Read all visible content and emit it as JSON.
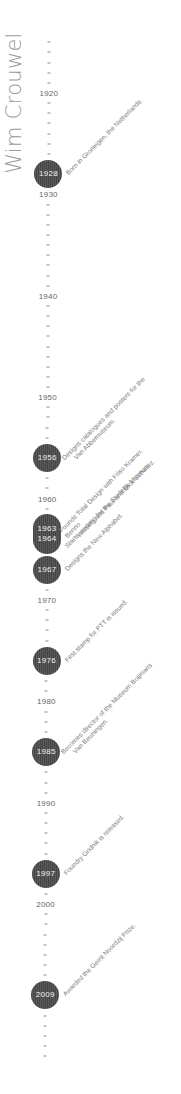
{
  "title": "Wim Crouwel",
  "axis": {
    "start_year": 1915,
    "end_year": 2015,
    "origin_year": 1920,
    "origin_y": 93,
    "px_per_year": 10.14,
    "x_top": 49,
    "x_bottom": 45,
    "decade_labels": [
      "1920",
      "1930",
      "1940",
      "1950",
      "1960",
      "1970",
      "1980",
      "1990",
      "2000"
    ]
  },
  "events": [
    {
      "years": [
        "1928"
      ],
      "lines": [
        "Born in Groningen, the Netherlands."
      ]
    },
    {
      "years": [
        "1956"
      ],
      "lines": [
        "Designs catalogues and posters for the",
        "Van Abbemuseum."
      ]
    },
    {
      "years": [
        "1963",
        "1964"
      ],
      "lines": [
        "Founds Total Design with Friso Kramer, Benno",
        "Wissing and Paul and Dick Schwarz."
      ],
      "lines_b": [
        "Starts working for the Stedelijk Museum."
      ]
    },
    {
      "years": [
        "1967"
      ],
      "lines": [
        "Designs the New Alphabet."
      ]
    },
    {
      "years": [
        "1976"
      ],
      "lines": [
        "First stamp for PTT is issued."
      ]
    },
    {
      "years": [
        "1985"
      ],
      "lines": [
        "Becomes director of the Museum Boijmans",
        "Van Beuningen."
      ]
    },
    {
      "years": [
        "1997"
      ],
      "lines": [
        "Foundry Gridnik is released."
      ]
    },
    {
      "years": [
        "2009"
      ],
      "lines": [
        "Awarded the Gerrit Noordzij Prize."
      ]
    }
  ],
  "colors": {
    "dot": "#4a4a4a",
    "dot_text": "#f2f2f2",
    "tick": "#8a8a8a",
    "label": "#666666",
    "event_text": "#7a7a7a",
    "title": "#9a9a9a"
  }
}
